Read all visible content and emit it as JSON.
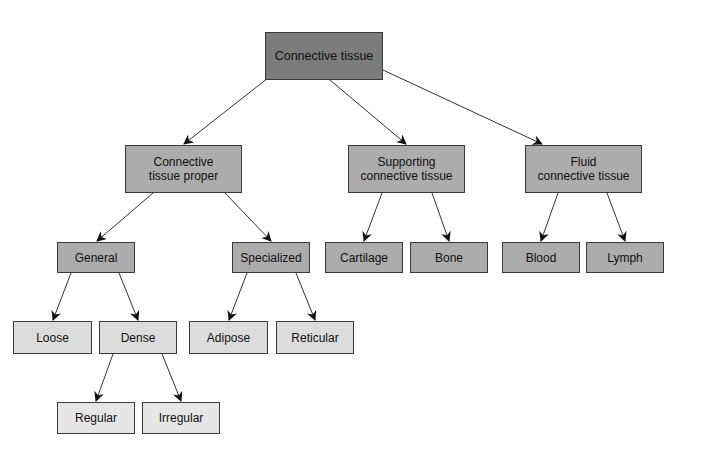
{
  "diagram": {
    "type": "hierarchy-tree",
    "colors": {
      "root_fill": "#7c7c7c",
      "level2_fill": "#acacac",
      "level3_fill": "#acacac",
      "leaf_fill": "#dcdcdc",
      "leaf_fill_bottom": "#e6e6e6",
      "border": "#3a3a3a",
      "arrow": "#222222"
    },
    "nodes": {
      "root": {
        "label": "Connective tissue"
      },
      "proper": {
        "label": "Connective\ntissue proper"
      },
      "supporting": {
        "label": "Supporting\nconnective tissue"
      },
      "fluid": {
        "label": "Fluid\nconnective tissue"
      },
      "general": {
        "label": "General"
      },
      "specialized": {
        "label": "Specialized"
      },
      "cartilage": {
        "label": "Cartilage"
      },
      "bone": {
        "label": "Bone"
      },
      "blood": {
        "label": "Blood"
      },
      "lymph": {
        "label": "Lymph"
      },
      "loose": {
        "label": "Loose"
      },
      "dense": {
        "label": "Dense"
      },
      "adipose": {
        "label": "Adipose"
      },
      "reticular": {
        "label": "Reticular"
      },
      "regular": {
        "label": "Regular"
      },
      "irregular": {
        "label": "Irregular"
      }
    },
    "edges": [
      [
        "root",
        "proper"
      ],
      [
        "root",
        "supporting"
      ],
      [
        "root",
        "fluid"
      ],
      [
        "proper",
        "general"
      ],
      [
        "proper",
        "specialized"
      ],
      [
        "supporting",
        "cartilage"
      ],
      [
        "supporting",
        "bone"
      ],
      [
        "fluid",
        "blood"
      ],
      [
        "fluid",
        "lymph"
      ],
      [
        "general",
        "loose"
      ],
      [
        "general",
        "dense"
      ],
      [
        "specialized",
        "adipose"
      ],
      [
        "specialized",
        "reticular"
      ],
      [
        "dense",
        "regular"
      ],
      [
        "dense",
        "irregular"
      ]
    ]
  }
}
